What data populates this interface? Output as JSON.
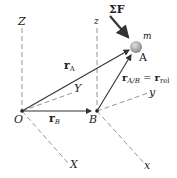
{
  "diagram": {
    "fixed_axes": {
      "Z": "Z",
      "Y": "Y",
      "X": "X"
    },
    "moving_axes": {
      "z": "z",
      "y": "y",
      "x": "x"
    },
    "points": {
      "origin": "O",
      "B": "B",
      "A": "A"
    },
    "mass": "m",
    "force": "ΣF",
    "vectors": {
      "rA": {
        "main": "r",
        "sub": "A"
      },
      "rB": {
        "main": "r",
        "sub": "B"
      },
      "rAB": {
        "main": "r",
        "sub": "A/B",
        "eq": " = ",
        "main2": "r",
        "sub2": "rel"
      }
    },
    "colors": {
      "line": "#333333",
      "dash": "#888888",
      "ball": "#b0b0b0"
    }
  }
}
